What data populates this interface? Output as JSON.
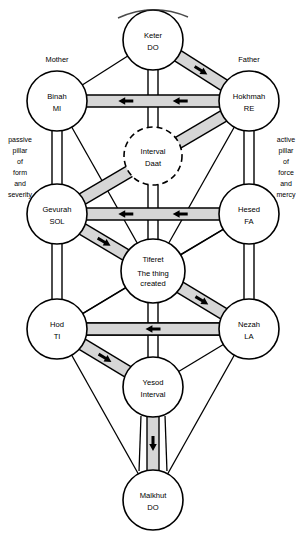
{
  "diagram": {
    "type": "kabbalistic-tree-diagram",
    "accent_color": "#d6d6d6",
    "line_color": "#000000",
    "background_color": "#ffffff"
  },
  "pillars": {
    "left": {
      "name": "passive-pillar",
      "lines": [
        "passive",
        "pillar",
        "of",
        "form",
        "and",
        "severity"
      ],
      "text": "passive pillar of form and severity"
    },
    "right": {
      "name": "active-pillar",
      "lines": [
        "active",
        "pillar",
        "of",
        "force",
        "and",
        "mercy"
      ],
      "text": "active pillar of force and mercy"
    }
  },
  "parent_labels": {
    "mother": "Mother",
    "father": "Father"
  },
  "sefirot": [
    {
      "id": "keter",
      "name": "Keter",
      "sub": "DO",
      "cx": 153,
      "cy": 40,
      "r": 30,
      "dashed": false
    },
    {
      "id": "binah",
      "name": "Binah",
      "sub": "MI",
      "cx": 57,
      "cy": 101,
      "r": 30,
      "dashed": false
    },
    {
      "id": "hokhmah",
      "name": "Hokhmah",
      "sub": "RE",
      "cx": 249,
      "cy": 101,
      "r": 30,
      "dashed": false
    },
    {
      "id": "daat",
      "name": "Interval",
      "sub": "Daat",
      "cx": 153,
      "cy": 156,
      "r": 29,
      "dashed": true
    },
    {
      "id": "gevurah",
      "name": "Gevurah",
      "sub": "SOL",
      "cx": 57,
      "cy": 214,
      "r": 30,
      "dashed": false
    },
    {
      "id": "hesed",
      "name": "Hesed",
      "sub": "FA",
      "cx": 249,
      "cy": 214,
      "r": 30,
      "dashed": false
    },
    {
      "id": "tiferet",
      "name": "Tiferet",
      "sub": "The thing created",
      "cx": 153,
      "cy": 271,
      "r": 32,
      "dashed": false
    },
    {
      "id": "hod",
      "name": "Hod",
      "sub": "TI",
      "cx": 57,
      "cy": 329,
      "r": 30,
      "dashed": false
    },
    {
      "id": "nezah",
      "name": "Nezah",
      "sub": "LA",
      "cx": 249,
      "cy": 329,
      "r": 30,
      "dashed": false
    },
    {
      "id": "yesod",
      "name": "Yesod",
      "sub": "Interval",
      "cx": 153,
      "cy": 387,
      "r": 30,
      "dashed": false
    },
    {
      "id": "malkhut",
      "name": "Malkhut",
      "sub": "DO",
      "cx": 153,
      "cy": 500,
      "r": 30,
      "dashed": false
    }
  ],
  "paths": [
    {
      "id": "binah-hokhmah",
      "from": "binah",
      "to": "hokhmah",
      "style": "shaded-channel",
      "arrows": 2,
      "direction": "left"
    },
    {
      "id": "gevurah-hesed",
      "from": "gevurah",
      "to": "hesed",
      "style": "shaded-channel",
      "arrows": 2,
      "direction": "left"
    },
    {
      "id": "hod-nezah",
      "from": "hod",
      "to": "nezah",
      "style": "shaded-channel",
      "arrows": 2,
      "direction": "left"
    },
    {
      "id": "keter-hokhmah",
      "from": "keter",
      "to": "hokhmah",
      "style": "shaded-channel",
      "arrows": 1,
      "direction": "down-right"
    },
    {
      "id": "hokhmah-gevurah",
      "from": "hokhmah",
      "to": "gevurah",
      "style": "shaded-channel",
      "arrows": 1,
      "direction": "down-left"
    },
    {
      "id": "gevurah-tiferet",
      "from": "gevurah",
      "to": "tiferet",
      "style": "shaded-channel",
      "arrows": 1,
      "direction": "down-right"
    },
    {
      "id": "tiferet-nezah",
      "from": "tiferet",
      "to": "nezah",
      "style": "shaded-channel",
      "arrows": 1,
      "direction": "down-right"
    },
    {
      "id": "nezah-hod",
      "from": "nezah",
      "to": "hod",
      "style": "shaded-channel",
      "arrows": 1,
      "direction": "left"
    },
    {
      "id": "hod-yesod",
      "from": "hod",
      "to": "yesod",
      "style": "shaded-channel",
      "arrows": 1,
      "direction": "down-right"
    },
    {
      "id": "binah-gevurah",
      "from": "binah",
      "to": "gevurah",
      "style": "plain-channel",
      "arrows": 0,
      "direction": "down"
    },
    {
      "id": "hokhmah-hesed",
      "from": "hokhmah",
      "to": "hesed",
      "style": "plain-channel",
      "arrows": 0,
      "direction": "down"
    },
    {
      "id": "gevurah-hod",
      "from": "gevurah",
      "to": "hod",
      "style": "plain-channel",
      "arrows": 0,
      "direction": "down"
    },
    {
      "id": "hesed-nezah",
      "from": "hesed",
      "to": "nezah",
      "style": "plain-channel",
      "arrows": 0,
      "direction": "down"
    },
    {
      "id": "keter-daat",
      "from": "keter",
      "to": "daat",
      "style": "plain-channel",
      "arrows": 0,
      "direction": "down"
    },
    {
      "id": "daat-tiferet",
      "from": "daat",
      "to": "tiferet",
      "style": "plain-channel",
      "arrows": 0,
      "direction": "down"
    },
    {
      "id": "tiferet-yesod",
      "from": "tiferet",
      "to": "yesod",
      "style": "plain-channel",
      "arrows": 0,
      "direction": "down"
    },
    {
      "id": "yesod-malkhut",
      "from": "yesod",
      "to": "malkhut",
      "style": "shaded-channel",
      "arrows": 1,
      "direction": "down"
    },
    {
      "id": "keter-binah",
      "from": "keter",
      "to": "binah",
      "style": "line",
      "arrows": 0,
      "direction": "down-left"
    },
    {
      "id": "binah-tiferet",
      "from": "binah",
      "to": "tiferet",
      "style": "line",
      "arrows": 0,
      "direction": "down-right"
    },
    {
      "id": "hokhmah-tiferet",
      "from": "hokhmah",
      "to": "tiferet",
      "style": "line",
      "arrows": 0,
      "direction": "down-left"
    },
    {
      "id": "hesed-tiferet",
      "from": "hesed",
      "to": "tiferet",
      "style": "line",
      "arrows": 0,
      "direction": "down-left"
    },
    {
      "id": "hesed-hod",
      "from": "hesed",
      "to": "hod",
      "style": "line",
      "arrows": 0,
      "direction": "down-left"
    },
    {
      "id": "gevurah-nezah",
      "from": "gevurah",
      "to": "nezah",
      "style": "line",
      "arrows": 0,
      "direction": "down-right"
    },
    {
      "id": "tiferet-hod",
      "from": "tiferet",
      "to": "hod",
      "style": "line",
      "arrows": 0,
      "direction": "down-left"
    },
    {
      "id": "nezah-yesod",
      "from": "nezah",
      "to": "yesod",
      "style": "line",
      "arrows": 0,
      "direction": "down-left"
    },
    {
      "id": "hod-malkhut",
      "from": "hod",
      "to": "malkhut",
      "style": "line",
      "arrows": 0,
      "direction": "down-right"
    },
    {
      "id": "nezah-malkhut",
      "from": "nezah",
      "to": "malkhut",
      "style": "line",
      "arrows": 0,
      "direction": "down-left"
    },
    {
      "id": "yesod-malkhut-l",
      "from": "yesod",
      "to": "malkhut",
      "style": "line",
      "arrows": 0,
      "direction": "down-left"
    },
    {
      "id": "yesod-malkhut-r",
      "from": "yesod",
      "to": "malkhut",
      "style": "line",
      "arrows": 0,
      "direction": "down-right"
    }
  ]
}
